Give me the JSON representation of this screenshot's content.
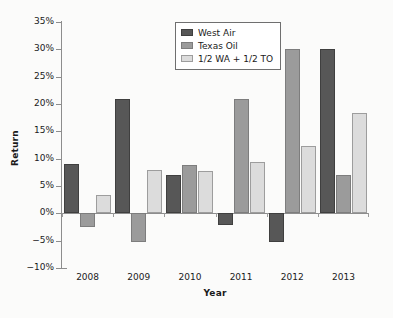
{
  "chart_data": {
    "type": "bar",
    "title": "",
    "xlabel": "Year",
    "ylabel": "Return",
    "categories": [
      "2008",
      "2009",
      "2010",
      "2011",
      "2012",
      "2013"
    ],
    "series": [
      {
        "name": "West Air",
        "color": "#575757",
        "values": [
          9.0,
          21.0,
          7.0,
          -2.2,
          -5.3,
          30.0
        ]
      },
      {
        "name": "Texas Oil",
        "color": "#9b9b9b",
        "values": [
          -2.5,
          -5.3,
          8.8,
          20.9,
          30.0,
          7.0
        ]
      },
      {
        "name": "1/2 WA + 1/2 TO",
        "color": "#dcdcdc",
        "values": [
          3.3,
          7.9,
          7.8,
          9.4,
          12.3,
          18.4
        ]
      }
    ],
    "ylim": [
      -10,
      35
    ],
    "ytick_values": [
      35,
      30,
      25,
      20,
      15,
      10,
      5,
      0,
      -5,
      -10
    ],
    "ytick_labels": [
      "35%",
      "30%",
      "25%",
      "20%",
      "15%",
      "10%",
      "5%",
      "0%",
      "−5%",
      "−10%"
    ],
    "grid": false,
    "legend_position": "upper-center",
    "zero_line": 0
  }
}
